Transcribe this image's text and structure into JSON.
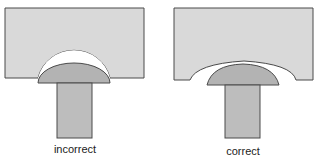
{
  "diagrams": [
    {
      "id": "incorrect",
      "caption": "incorrect"
    },
    {
      "id": "correct",
      "caption": "correct"
    }
  ],
  "colors": {
    "block_fill": "#d9d9d9",
    "cap_fill": "#b3b3b3",
    "stem_fill": "#bdbdbd",
    "gap_fill": "#ffffff",
    "stroke": "#4a4a4a"
  }
}
